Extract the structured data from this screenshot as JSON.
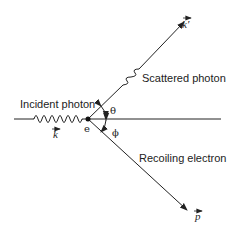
{
  "diagram": {
    "labels": {
      "incident": "Incident photon",
      "scattered": "Scattered photon",
      "recoil": "Recoiling electron",
      "electron": "e",
      "theta": "θ",
      "phi": "ϕ",
      "k_in": "k",
      "k_out": "k′",
      "p": "p"
    },
    "colors": {
      "line": "#222222",
      "text": "#222222",
      "background": "#ffffff"
    }
  }
}
